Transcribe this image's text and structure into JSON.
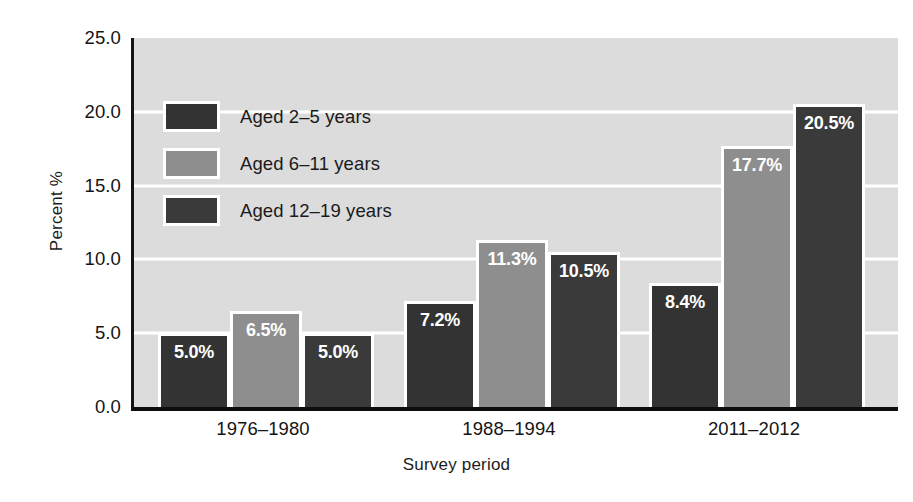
{
  "chart_data": {
    "type": "bar",
    "title": "",
    "xlabel": "Survey period",
    "ylabel": "Percent %",
    "categories": [
      "1976–1980",
      "1988–1994",
      "2011–2012"
    ],
    "series": [
      {
        "name": "Aged 2–5 years",
        "color": "#333333",
        "values": [
          5.0,
          7.2,
          8.4
        ],
        "labels": [
          "5.0%",
          "7.2%",
          "8.4%"
        ]
      },
      {
        "name": "Aged 6–11 years",
        "color": "#8e8e8e",
        "values": [
          6.5,
          11.3,
          17.7
        ],
        "labels": [
          "6.5%",
          "11.3%",
          "17.7%"
        ]
      },
      {
        "name": "Aged 12–19 years",
        "color": "#3a3a3a",
        "values": [
          5.0,
          10.5,
          20.5
        ],
        "labels": [
          "5.0%",
          "10.5%",
          "20.5%"
        ]
      }
    ],
    "ylim": [
      0.0,
      25.0
    ],
    "ytick_labels": [
      "25.0",
      "20.0",
      "15.0",
      "10.0",
      "5.0",
      "0.0"
    ],
    "ytick_values": [
      25.0,
      20.0,
      15.0,
      10.0,
      5.0,
      0.0
    ],
    "gridlines": [
      20.0,
      15.0,
      10.0,
      5.0
    ],
    "grid": true,
    "grid_color": "#ffffff",
    "plot_background": "#dcdcdc",
    "legend_position": "upper-left-inside",
    "bar_label_color": "#ffffff"
  },
  "axes": {
    "y_title": "Percent %",
    "x_title": "Survey period"
  }
}
